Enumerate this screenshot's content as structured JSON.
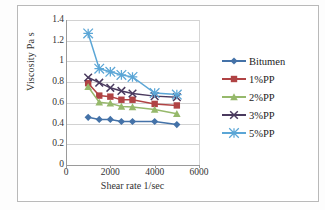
{
  "chart_data": {
    "type": "line",
    "title": "",
    "xlabel": "Shear rate 1/sec",
    "ylabel": "Viscosity Pa s",
    "x": [
      1000,
      1500,
      2000,
      2500,
      3000,
      4000,
      5000
    ],
    "xlim": [
      0,
      6000
    ],
    "ylim": [
      0,
      1.4
    ],
    "xticks": [
      "0",
      "2000",
      "4000",
      "6000"
    ],
    "xtick_values": [
      0,
      2000,
      4000,
      6000
    ],
    "yticks": [
      "0",
      "0.2",
      "0.4",
      "0.6",
      "0.8",
      "1",
      "1.2",
      "1.4"
    ],
    "ytick_values": [
      0,
      0.2,
      0.4,
      0.6,
      0.8,
      1,
      1.2,
      1.4
    ],
    "grid": "horizontal",
    "legend_position": "right",
    "series": [
      {
        "name": "Bitumen",
        "color": "#4472a8",
        "marker": "diamond",
        "values": [
          0.46,
          0.44,
          0.44,
          0.42,
          0.42,
          0.42,
          0.39
        ]
      },
      {
        "name": "1%PP",
        "color": "#b04344",
        "marker": "square",
        "values": [
          0.79,
          0.67,
          0.66,
          0.63,
          0.63,
          0.59,
          0.575
        ]
      },
      {
        "name": "2%PP",
        "color": "#96b96b",
        "marker": "triangle",
        "values": [
          0.755,
          0.605,
          0.595,
          0.565,
          0.56,
          0.535,
          0.495
        ]
      },
      {
        "name": "3%PP",
        "color": "#4a3a5e",
        "marker": "cross",
        "values": [
          0.845,
          0.795,
          0.745,
          0.715,
          0.69,
          0.665,
          0.655
        ]
      },
      {
        "name": "5%PP",
        "color": "#5ba6d6",
        "marker": "star",
        "values": [
          1.27,
          0.93,
          0.9,
          0.87,
          0.85,
          0.695,
          0.68
        ]
      }
    ]
  }
}
